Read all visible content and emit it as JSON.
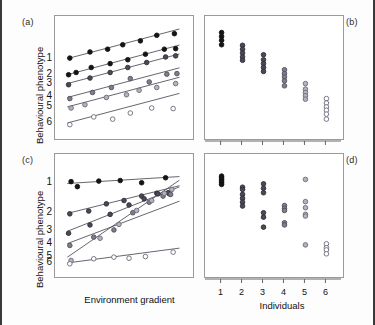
{
  "figure": {
    "panels": [
      {
        "key": "a",
        "letter": "(a)"
      },
      {
        "key": "b",
        "letter": "(b)"
      },
      {
        "key": "c",
        "letter": "(c)"
      },
      {
        "key": "d",
        "letter": "(d)"
      }
    ],
    "axis_titles": {
      "y_top": "Behavioural phenotype",
      "y_bottom": "Behavioural phenotype",
      "x_left": "Environment gradient",
      "x_right": "Individuals"
    },
    "series_labels": [
      "1",
      "2",
      "3",
      "4",
      "5",
      "6"
    ],
    "individual_ticks": [
      "1",
      "2",
      "3",
      "4",
      "5",
      "6"
    ],
    "marker_colors": [
      "#111111",
      "#3b3b46",
      "#555562",
      "#6e6e7c",
      "#8a8a98",
      "#ffffff"
    ],
    "marker_fill_open": "#ffffff",
    "line_color": "#4a4a55",
    "frame_color": "#9a9a9a",
    "border_color": "#3a3a3a"
  },
  "chart_data": [
    {
      "type": "scatter",
      "panel": "a",
      "title": "",
      "xlabel": "Environment gradient",
      "ylabel": "Behavioural phenotype",
      "xlim": [
        0,
        10
      ],
      "ylim": [
        0,
        10
      ],
      "grid": false,
      "legend": "none",
      "description": "Six parallel reaction norms: equal positive slopes, differing intercepts (no genotype-by-environment interaction).",
      "series": [
        {
          "name": "1",
          "marker": "filled",
          "slope": 0.3,
          "intercept": 6.55,
          "x": [
            0.7,
            2.3,
            3.7,
            4.9,
            6.3,
            7.6,
            9.0
          ],
          "y": [
            6.75,
            7.3,
            7.55,
            7.95,
            8.3,
            8.8,
            8.95
          ]
        },
        {
          "name": "2",
          "marker": "filled",
          "slope": 0.3,
          "intercept": 5.1,
          "x": [
            0.6,
            1.2,
            2.4,
            3.9,
            5.3,
            6.7,
            8.2,
            9.1
          ],
          "y": [
            5.25,
            5.45,
            5.9,
            6.25,
            6.6,
            7.1,
            7.55,
            7.6
          ]
        },
        {
          "name": "3",
          "marker": "dark",
          "slope": 0.3,
          "intercept": 4.3,
          "x": [
            0.6,
            2.3,
            3.9,
            5.3,
            6.8,
            8.3,
            9.1
          ],
          "y": [
            4.35,
            4.95,
            5.45,
            5.9,
            6.35,
            6.85,
            6.95
          ]
        },
        {
          "name": "4",
          "marker": "mid",
          "slope": 0.3,
          "intercept": 3.05,
          "x": [
            0.7,
            2.5,
            4.0,
            5.5,
            7.0,
            8.4,
            9.2
          ],
          "y": [
            3.1,
            3.65,
            4.1,
            4.9,
            4.6,
            5.3,
            5.35
          ]
        },
        {
          "name": "5",
          "marker": "light",
          "slope": 0.3,
          "intercept": 2.2,
          "x": [
            0.8,
            1.9,
            3.6,
            5.2,
            6.2,
            7.6,
            9.1
          ],
          "y": [
            2.25,
            2.55,
            3.2,
            3.45,
            3.85,
            4.1,
            4.45
          ]
        },
        {
          "name": "6",
          "marker": "open",
          "slope": 0.3,
          "intercept": 0.75,
          "x": [
            0.7,
            2.6,
            4.1,
            5.5,
            7.2,
            8.9
          ],
          "y": [
            0.75,
            1.45,
            1.25,
            1.8,
            2.25,
            2.2
          ]
        }
      ]
    },
    {
      "type": "scatter",
      "panel": "b",
      "title": "",
      "xlabel": "Individuals",
      "ylabel": "",
      "xlim": [
        0.4,
        6.6
      ],
      "ylim": [
        0,
        10
      ],
      "grid": false,
      "legend": "none",
      "description": "Individual phenotype values per individual: tight clusters descending in a staircase from individual 1 to 6.",
      "clusters": [
        {
          "individual": "1",
          "marker": "filled",
          "values": [
            9.05,
            8.7,
            8.35,
            7.95
          ]
        },
        {
          "individual": "2",
          "marker": "dark",
          "values": [
            7.9,
            7.55,
            7.2,
            6.85,
            6.55
          ]
        },
        {
          "individual": "3",
          "marker": "dark",
          "values": [
            7.05,
            6.6,
            6.25,
            5.9,
            5.55
          ]
        },
        {
          "individual": "4",
          "marker": "mid",
          "values": [
            5.7,
            5.35,
            5.05,
            4.7,
            4.25
          ]
        },
        {
          "individual": "5",
          "marker": "light",
          "values": [
            4.45,
            3.95,
            3.65,
            3.35,
            3.05
          ]
        },
        {
          "individual": "6",
          "marker": "open",
          "values": [
            3.1,
            2.7,
            2.35,
            2.05,
            1.7,
            1.25
          ]
        }
      ]
    },
    {
      "type": "scatter",
      "panel": "c",
      "title": "",
      "xlabel": "Environment gradient",
      "ylabel": "Behavioural phenotype",
      "xlim": [
        0,
        10
      ],
      "ylim": [
        0,
        10
      ],
      "grid": false,
      "legend": "none",
      "description": "Six reaction norms with differing slopes that converge and cross near the right of the gradient (genotype-by-environment interaction).",
      "series": [
        {
          "name": "1",
          "marker": "filled",
          "slope": 0.07,
          "intercept": 7.85,
          "x": [
            0.8,
            1.3,
            3.0,
            4.7,
            6.4,
            8.3
          ],
          "y": [
            8.05,
            7.6,
            8.1,
            8.15,
            7.95,
            8.4
          ]
        },
        {
          "name": "2",
          "marker": "dark",
          "slope": 0.28,
          "intercept": 5.05,
          "x": [
            0.7,
            2.2,
            3.6,
            5.0,
            6.4,
            7.6,
            8.6
          ],
          "y": [
            5.15,
            5.4,
            6.05,
            6.35,
            6.75,
            7.0,
            6.95
          ]
        },
        {
          "name": "3",
          "marker": "dark",
          "slope": 0.45,
          "intercept": 3.35,
          "x": [
            0.6,
            2.3,
            3.9,
            5.4,
            6.6,
            7.7,
            8.5
          ],
          "y": [
            3.4,
            4.15,
            5.1,
            5.95,
            6.5,
            6.95,
            7.05
          ]
        },
        {
          "name": "4",
          "marker": "mid",
          "slope": 0.43,
          "intercept": 2.25,
          "x": [
            0.7,
            2.6,
            4.2,
            5.7,
            7.0,
            8.1,
            8.7
          ],
          "y": [
            2.3,
            3.05,
            3.7,
            5.25,
            6.2,
            6.75,
            6.9
          ]
        },
        {
          "name": "5",
          "marker": "light",
          "slope": 0.78,
          "intercept": 0.85,
          "x": [
            0.8,
            3.1,
            4.6,
            6.0,
            7.2,
            8.2,
            8.8
          ],
          "y": [
            0.95,
            2.95,
            4.2,
            5.45,
            6.35,
            7.0,
            7.35
          ]
        },
        {
          "name": "6",
          "marker": "open",
          "slope": 0.15,
          "intercept": 0.65,
          "x": [
            0.7,
            2.6,
            4.2,
            5.4,
            6.7,
            8.9
          ],
          "y": [
            0.65,
            1.1,
            1.25,
            1.15,
            1.3,
            1.7
          ]
        }
      ]
    },
    {
      "type": "scatter",
      "panel": "d",
      "title": "",
      "xlabel": "Individuals",
      "ylabel": "",
      "xlim": [
        0.4,
        6.6
      ],
      "ylim": [
        0,
        10
      ],
      "grid": false,
      "legend": "none",
      "description": "Individual phenotype values per individual: spread differs markedly between individuals, individual 1 very tight and individual 5 widely dispersed.",
      "clusters": [
        {
          "individual": "1",
          "marker": "filled",
          "values": [
            8.55,
            8.4,
            8.25,
            8.1,
            7.95,
            7.8
          ]
        },
        {
          "individual": "2",
          "marker": "dark",
          "values": [
            7.55,
            7.35,
            6.9,
            6.55,
            6.2,
            5.85
          ]
        },
        {
          "individual": "3",
          "marker": "dark",
          "values": [
            7.85,
            7.45,
            7.05,
            5.25,
            4.85,
            3.95
          ]
        },
        {
          "individual": "4",
          "marker": "mid",
          "values": [
            5.9,
            5.65,
            5.45,
            4.35,
            4.15
          ]
        },
        {
          "individual": "5",
          "marker": "light",
          "values": [
            8.25,
            6.25,
            5.7,
            5.1,
            4.95,
            2.35
          ]
        },
        {
          "individual": "6",
          "marker": "open",
          "values": [
            2.45,
            2.1,
            1.9,
            1.55
          ]
        }
      ]
    }
  ]
}
